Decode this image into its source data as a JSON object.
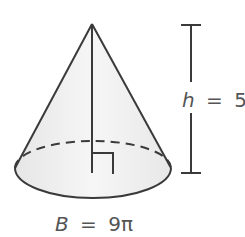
{
  "figure": {
    "shape": "right circular cone",
    "height_label": {
      "var": "h",
      "eq": "=",
      "value": "5"
    },
    "base_label": {
      "var": "B",
      "eq": "=",
      "value": "9π"
    },
    "colors": {
      "stroke": "#3a3a3a",
      "fill": "#f0f0f0",
      "fill_base": "#ececec",
      "text": "#555555"
    }
  }
}
